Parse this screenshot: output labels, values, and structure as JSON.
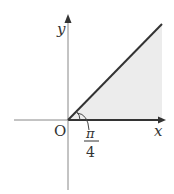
{
  "diagram": {
    "axes": {
      "x_label": "x",
      "y_label": "y",
      "origin_label": "O"
    },
    "angle": {
      "numerator": "π",
      "denominator": "4"
    },
    "colors": {
      "axis": "#888888",
      "line": "#333333",
      "fill": "#ececec"
    }
  }
}
